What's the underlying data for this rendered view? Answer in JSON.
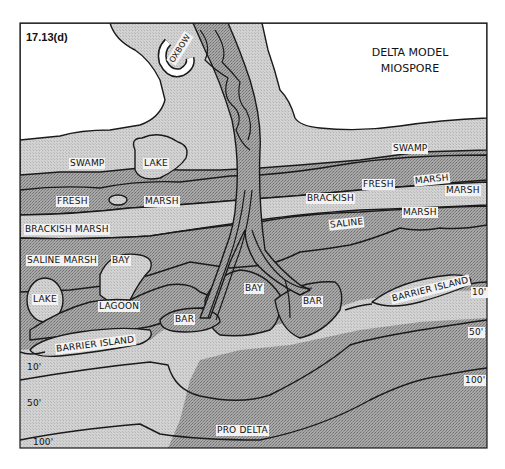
{
  "figure": {
    "id_label": "17.13(d)",
    "title_line1": "DELTA MODEL",
    "title_line2": "MIOSPORE"
  },
  "colors": {
    "dark_fill": "#9c9c9c",
    "light_fill": "#cbcbcb",
    "white_fill": "#ffffff",
    "outline": "#1a1a1a"
  },
  "labels": {
    "oxbow": "OXBOW",
    "swamp_left": "SWAMP",
    "lake_top": "LAKE",
    "swamp_right": "SWAMP",
    "fresh_left": "FRESH",
    "marsh_left": "MARSH",
    "fresh_right": "FRESH",
    "marsh_right1": "MARSH",
    "marsh_right2": "MARSH",
    "brackish_marsh": "BRACKISH MARSH",
    "brackish_right": "BRACKISH",
    "saline_right": "SALINE",
    "marsh_right3": "MARSH",
    "saline_marsh": "SALINE MARSH",
    "bay_left": "BAY",
    "lake_left": "LAKE",
    "lagoon": "LAGOON",
    "bay_center": "BAY",
    "bar_left": "BAR",
    "bar_right": "BAR",
    "barrier_island_left": "BARRIER ISLAND",
    "barrier_island_right": "BARRIER ISLAND",
    "pro_delta": "PRO DELTA"
  },
  "depth_contours": {
    "left": [
      "10'",
      "50'",
      "100'"
    ],
    "right": [
      "10'",
      "50'",
      "100'"
    ]
  }
}
